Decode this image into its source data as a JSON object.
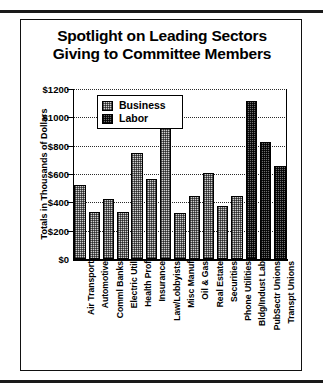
{
  "figure": {
    "title_line1": "Spotlight on Leading Sectors",
    "title_line2": "Giving to Committee Members",
    "y_axis_title": "Totals in Thousands of Dollars"
  },
  "legend": {
    "position": "inside-top-left",
    "items": [
      {
        "label": "Business",
        "swatch": "light-stipple-swatch",
        "color": "#cfcfcf"
      },
      {
        "label": "Labor",
        "swatch": "dark-stipple-swatch",
        "color": "#6d6d6d"
      }
    ]
  },
  "chart_data": {
    "type": "bar",
    "title": "Spotlight on Leading Sectors Giving to Committee Members",
    "xlabel": "",
    "ylabel": "Totals in Thousands of Dollars",
    "ylim": [
      0,
      1200
    ],
    "yticks": [
      0,
      200,
      400,
      600,
      800,
      1000,
      1200
    ],
    "ytick_labels": [
      "$0",
      "$200",
      "$400",
      "$600",
      "$800",
      "$1000",
      "$1200"
    ],
    "grid": true,
    "legend": [
      "Business",
      "Labor"
    ],
    "categories": [
      "Air Transport",
      "Automotive",
      "Comml Banks",
      "Electric Util",
      "Health Prof",
      "Insurance",
      "Law/Lobbyists",
      "Misc Manuf",
      "Oil & Gas",
      "Real Estate",
      "Securities",
      "Phone Utilities",
      "Bldg/Indust Lab",
      "PubSectr Unions",
      "Transpt Unions"
    ],
    "values": [
      520,
      330,
      425,
      330,
      750,
      565,
      1030,
      325,
      445,
      610,
      375,
      445,
      1115,
      825,
      655
    ],
    "groups": [
      "Business",
      "Business",
      "Business",
      "Business",
      "Business",
      "Business",
      "Business",
      "Business",
      "Business",
      "Business",
      "Business",
      "Business",
      "Labor",
      "Labor",
      "Labor"
    ]
  }
}
